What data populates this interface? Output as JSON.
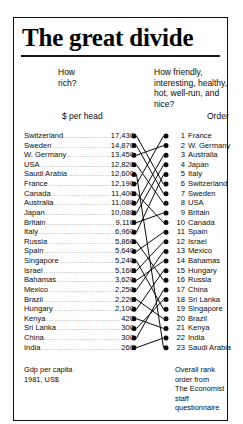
{
  "chart_data": {
    "type": "table",
    "title": "The great divide",
    "left_question": "How\nrich?",
    "right_question": "How friendly,\ninteresting, healthy,\nhot, well-run, and\nnice?",
    "left_column_header": "$ per head",
    "right_column_header": "Order",
    "left_footnote": "Gdp per capita\n1981, US$",
    "right_footnote": "Overall rank\norder from\nThe Economist\nstaff questionnaire",
    "xlabel": "",
    "ylabel": "",
    "left_series_name": "Gdp per capita 1981, US$",
    "right_series_name": "Overall rank order from The Economist staff questionnaire",
    "categories": [
      "Switzerland",
      "Sweden",
      "W. Germany",
      "USA",
      "Saudi Arabia",
      "France",
      "Canada",
      "Australia",
      "Japan",
      "Britain",
      "Italy",
      "Russia",
      "Spain",
      "Singapore",
      "Israel",
      "Bahamas",
      "Mexico",
      "Brazil",
      "Hungary",
      "Kenya",
      "Sri Lanka",
      "China",
      "India"
    ],
    "left_rows": [
      {
        "name": "Switzerland",
        "value": "17,430",
        "rank": 1
      },
      {
        "name": "Sweden",
        "value": "14,870",
        "rank": 2
      },
      {
        "name": "W. Germany",
        "value": "13,450",
        "rank": 3
      },
      {
        "name": "USA",
        "value": "12,820",
        "rank": 4
      },
      {
        "name": "Saudi Arabia",
        "value": "12,600",
        "rank": 5
      },
      {
        "name": "France",
        "value": "12,190",
        "rank": 6
      },
      {
        "name": "Canada",
        "value": "11,400",
        "rank": 7
      },
      {
        "name": "Australia",
        "value": "11,080",
        "rank": 8
      },
      {
        "name": "Japan",
        "value": "10,080",
        "rank": 9
      },
      {
        "name": "Britain",
        "value": "9,110",
        "rank": 10
      },
      {
        "name": "Italy",
        "value": "6,960",
        "rank": 11
      },
      {
        "name": "Russia",
        "value": "5,860",
        "rank": 12
      },
      {
        "name": "Spain",
        "value": "5,640",
        "rank": 13
      },
      {
        "name": "Singapore",
        "value": "5,240",
        "rank": 14
      },
      {
        "name": "Israel",
        "value": "5,160",
        "rank": 15
      },
      {
        "name": "Bahamas",
        "value": "3,620",
        "rank": 16
      },
      {
        "name": "Mexico",
        "value": "2,250",
        "rank": 17
      },
      {
        "name": "Brazil",
        "value": "2,220",
        "rank": 18
      },
      {
        "name": "Hungary",
        "value": "2,100",
        "rank": 19
      },
      {
        "name": "Kenya",
        "value": "420",
        "rank": 20
      },
      {
        "name": "Sri Lanka",
        "value": "300",
        "rank": 21
      },
      {
        "name": "China",
        "value": "300",
        "rank": 22
      },
      {
        "name": "India",
        "value": "260",
        "rank": 23
      }
    ],
    "right_rows": [
      {
        "rank": 1,
        "name": "France"
      },
      {
        "rank": 2,
        "name": "W. Germany"
      },
      {
        "rank": 3,
        "name": "Australia"
      },
      {
        "rank": 4,
        "name": "Japan"
      },
      {
        "rank": 5,
        "name": "Italy"
      },
      {
        "rank": 6,
        "name": "Switzerland"
      },
      {
        "rank": 7,
        "name": "Sweden"
      },
      {
        "rank": 8,
        "name": "USA"
      },
      {
        "rank": 9,
        "name": "Britain"
      },
      {
        "rank": 10,
        "name": "Canada"
      },
      {
        "rank": 11,
        "name": "Spain"
      },
      {
        "rank": 12,
        "name": "Israel"
      },
      {
        "rank": 13,
        "name": "Mexico"
      },
      {
        "rank": 14,
        "name": "Bahamas"
      },
      {
        "rank": 15,
        "name": "Hungary"
      },
      {
        "rank": 16,
        "name": "Russia"
      },
      {
        "rank": 17,
        "name": "China"
      },
      {
        "rank": 18,
        "name": "Sri Lanka"
      },
      {
        "rank": 19,
        "name": "Singapore"
      },
      {
        "rank": 20,
        "name": "Brazil"
      },
      {
        "rank": 21,
        "name": "Kenya"
      },
      {
        "rank": 22,
        "name": "India"
      },
      {
        "rank": 23,
        "name": "Saudi Arabia"
      }
    ],
    "colors": {
      "ink": "#0b0b0b",
      "frame": "#111111",
      "leader": "#8a8a8a"
    },
    "grid": false,
    "legend": "none"
  }
}
